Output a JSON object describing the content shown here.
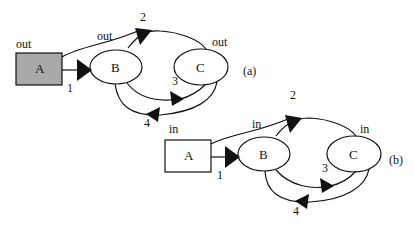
{
  "diagrams": [
    {
      "id": "a",
      "caption": "(a)",
      "nodes": {
        "A": "A",
        "B": "B",
        "C": "C"
      },
      "port_labels": {
        "A": "out",
        "B": "out",
        "C": "out"
      },
      "edge_labels": {
        "e1": "1",
        "e2": "2",
        "e3": "3",
        "e4": "4"
      },
      "colors": {
        "A_fill": "#a9a9a9"
      }
    },
    {
      "id": "b",
      "caption": "(b)",
      "nodes": {
        "A": "A",
        "B": "B",
        "C": "C"
      },
      "port_labels": {
        "A": "in",
        "B": "in",
        "C": "in"
      },
      "edge_labels": {
        "e1": "1",
        "e2": "2",
        "e3": "3",
        "e4": "4"
      },
      "colors": {
        "A_fill": "#ffffff"
      }
    }
  ]
}
